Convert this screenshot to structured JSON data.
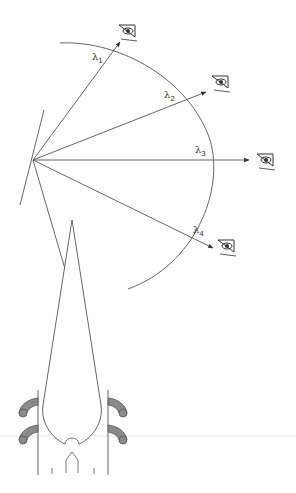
{
  "figure": {
    "colors": {
      "line": "#555555",
      "hook_fill": "#8a8a8a",
      "hook_stroke": "#555555",
      "faint_line": "#e6e6e6"
    },
    "labels": [
      {
        "symbol": "λ",
        "sub": "1"
      },
      {
        "symbol": "λ",
        "sub": "2"
      },
      {
        "symbol": "λ",
        "sub": "3"
      },
      {
        "symbol": "λ",
        "sub": "4"
      }
    ],
    "observers": [
      "eye-icon",
      "eye-icon",
      "eye-icon",
      "eye-icon"
    ]
  }
}
